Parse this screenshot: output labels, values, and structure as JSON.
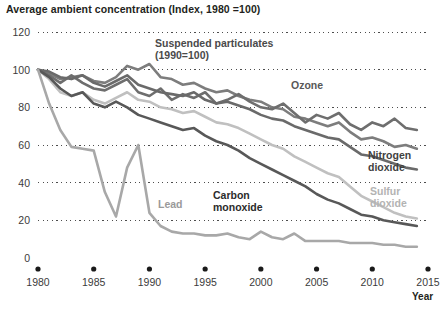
{
  "chart_data": {
    "type": "line",
    "title": "Average ambient concentration (Index, 1980 =100)",
    "xlabel": "Year",
    "ylabel": "",
    "xlim": [
      1980,
      2015
    ],
    "ylim": [
      0,
      120
    ],
    "grid": "horizontal-dotted",
    "legend": "inline-annotations",
    "xticks": [
      "1980",
      "1985",
      "1990",
      "1995",
      "2000",
      "2005",
      "2010",
      "2015"
    ],
    "xtick_values": [
      1980,
      1985,
      1990,
      1995,
      2000,
      2005,
      2010,
      2015
    ],
    "yticks": [
      "0",
      "20",
      "40",
      "60",
      "80",
      "100",
      "120"
    ],
    "ytick_values": [
      0,
      20,
      40,
      60,
      80,
      100,
      120
    ],
    "x": [
      1980,
      1981,
      1982,
      1983,
      1984,
      1985,
      1986,
      1987,
      1988,
      1989,
      1990,
      1991,
      1992,
      1993,
      1994,
      1995,
      1996,
      1997,
      1998,
      1999,
      2000,
      2001,
      2002,
      2003,
      2004,
      2005,
      2006,
      2007,
      2008,
      2009,
      2010,
      2011,
      2012,
      2013,
      2014
    ],
    "series": [
      {
        "name": "Suspended particulates",
        "note": "(1990=100)",
        "color": "#7d7d7d",
        "label_color": "#4a4a4a",
        "values": [
          100,
          98,
          95,
          96,
          97,
          94,
          93,
          96,
          102,
          100,
          103,
          96,
          95,
          92,
          93,
          90,
          88,
          89,
          86,
          84,
          83,
          80,
          79,
          75,
          74,
          72,
          70,
          72,
          67,
          63,
          64,
          62,
          59,
          60,
          58
        ]
      },
      {
        "name": "Ozone",
        "color": "#6e6e6e",
        "label_color": "#585858",
        "values": [
          100,
          97,
          93,
          97,
          93,
          90,
          89,
          92,
          95,
          88,
          86,
          90,
          84,
          87,
          85,
          88,
          82,
          84,
          87,
          83,
          80,
          79,
          82,
          77,
          72,
          76,
          74,
          77,
          71,
          68,
          72,
          70,
          74,
          69,
          68
        ]
      },
      {
        "name": "Nitrogen dioxide",
        "color": "#6a6a6a",
        "label_color": "#3f3f3f",
        "values": [
          100,
          99,
          96,
          95,
          97,
          93,
          91,
          94,
          97,
          92,
          90,
          88,
          87,
          86,
          88,
          84,
          82,
          83,
          81,
          79,
          76,
          74,
          73,
          70,
          68,
          66,
          64,
          63,
          59,
          55,
          54,
          52,
          50,
          48,
          47
        ]
      },
      {
        "name": "Sulfur dioxide",
        "color": "#c0c0c0",
        "label_color": "#b3b3b3",
        "values": [
          100,
          95,
          88,
          86,
          88,
          84,
          82,
          85,
          88,
          84,
          83,
          80,
          79,
          77,
          78,
          75,
          72,
          71,
          69,
          66,
          63,
          60,
          58,
          54,
          51,
          48,
          45,
          43,
          38,
          33,
          30,
          27,
          24,
          22,
          21
        ]
      },
      {
        "name": "Carbon monoxide",
        "color": "#585858",
        "label_color": "#2b2b2b",
        "values": [
          100,
          96,
          90,
          86,
          88,
          82,
          80,
          83,
          80,
          76,
          74,
          72,
          70,
          68,
          69,
          65,
          62,
          60,
          57,
          53,
          50,
          47,
          44,
          41,
          38,
          34,
          31,
          29,
          26,
          23,
          22,
          20,
          19,
          18,
          17
        ]
      },
      {
        "name": "Lead",
        "color": "#a8a8a8",
        "label_color": "#9a9a9a",
        "values": [
          100,
          82,
          68,
          59,
          58,
          57,
          35,
          22,
          48,
          60,
          24,
          17,
          14,
          13,
          13,
          12,
          12,
          13,
          11,
          10,
          14,
          11,
          10,
          13,
          9,
          9,
          9,
          9,
          8,
          8,
          8,
          7,
          7,
          6,
          6
        ]
      }
    ],
    "annotations": [
      {
        "text": "Suspended particulates",
        "sub": "(1990=100)",
        "series": "Suspended particulates"
      },
      {
        "text": "Ozone",
        "series": "Ozone"
      },
      {
        "text": "Nitrogen",
        "sub": "dioxide",
        "series": "Nitrogen dioxide"
      },
      {
        "text": "Sulfur",
        "sub": "dioxide",
        "series": "Sulfur dioxide"
      },
      {
        "text": "Carbon",
        "sub": "monoxide",
        "series": "Carbon monoxide"
      },
      {
        "text": "Lead",
        "series": "Lead"
      }
    ]
  },
  "labels": {
    "suspended_line1": "Suspended particulates",
    "suspended_line2": "(1990=100)",
    "ozone": "Ozone",
    "nitrogen_line1": "Nitrogen",
    "nitrogen_line2": "dioxide",
    "sulfur_line1": "Sulfur",
    "sulfur_line2": "dioxide",
    "carbon_line1": "Carbon",
    "carbon_line2": "monoxide",
    "lead": "Lead",
    "year": "Year"
  }
}
